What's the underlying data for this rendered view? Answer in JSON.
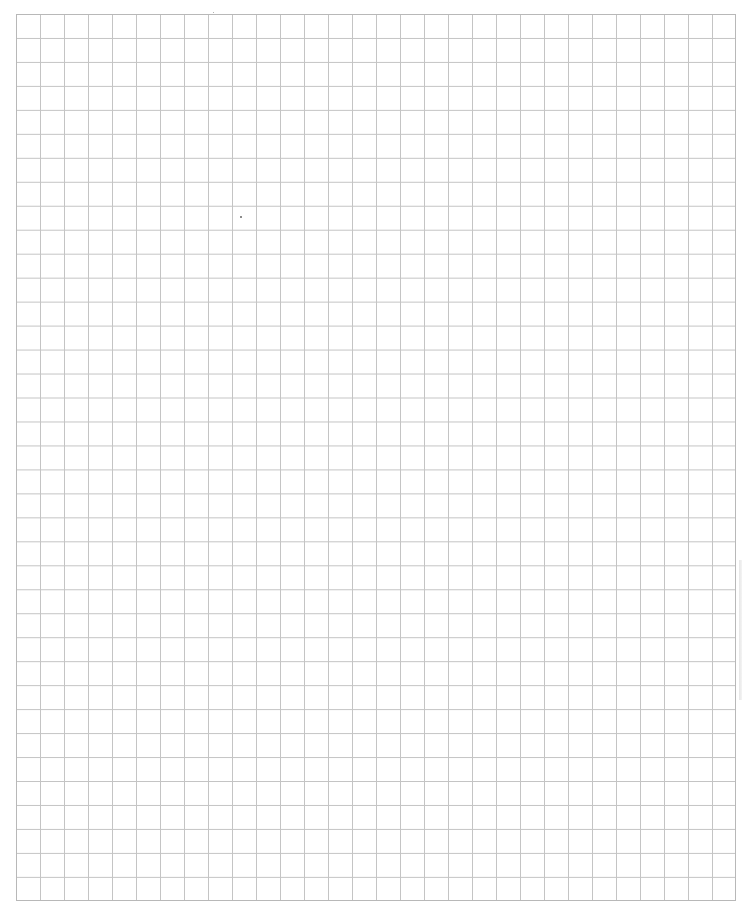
{
  "page": {
    "type": "graph-paper",
    "grid": {
      "columns": 30,
      "rows": 37,
      "cell_size_px": 24,
      "line_color": "#c4c4c4",
      "border_color": "#b8b8b8",
      "background_color": "#ffffff"
    },
    "marks": [
      {
        "name": "ink-speck",
        "x": 240,
        "y": 216
      },
      {
        "name": "ink-speck",
        "x": 213,
        "y": 12
      }
    ]
  }
}
